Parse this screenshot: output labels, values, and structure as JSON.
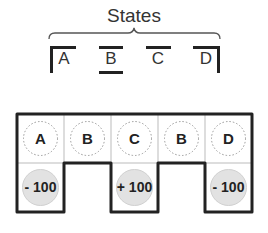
{
  "header": {
    "title": "States"
  },
  "states": [
    {
      "label": "A",
      "marker": "left-corner"
    },
    {
      "label": "B",
      "marker": "top-bottom-bars"
    },
    {
      "label": "C",
      "marker": "top-bar"
    },
    {
      "label": "D",
      "marker": "right-corner"
    }
  ],
  "grid": {
    "top_row": [
      "A",
      "B",
      "C",
      "B",
      "D"
    ],
    "bottom_row": [
      {
        "column": 0,
        "reward": "- 100"
      },
      {
        "column": 2,
        "reward": "+ 100"
      },
      {
        "column": 4,
        "reward": "- 100"
      }
    ]
  },
  "colors": {
    "line": "#222222",
    "cell_border": "#bbbbbb",
    "dotted_circle": "#999999",
    "reward_fill": "#e2e2e2"
  }
}
